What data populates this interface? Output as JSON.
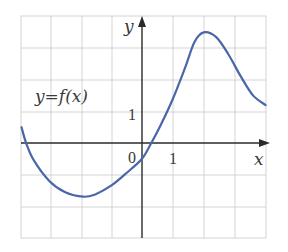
{
  "chart_data": {
    "type": "line",
    "title": "",
    "function_label": "y=f(x)",
    "xlabel": "x",
    "ylabel": "y",
    "origin_label": "0",
    "x_tick_label": "1",
    "y_tick_label": "1",
    "xlim": [
      -3.9,
      4.0
    ],
    "ylim": [
      -3.05,
      4.1
    ],
    "grid": true,
    "grid_step": 1,
    "series": [
      {
        "name": "f(x)",
        "color": "#4a66a8",
        "points": [
          [
            -3.9,
            0.5
          ],
          [
            -3.75,
            0.0
          ],
          [
            -3.5,
            -0.55
          ],
          [
            -3.0,
            -1.2
          ],
          [
            -2.5,
            -1.55
          ],
          [
            -1.9,
            -1.7
          ],
          [
            -1.5,
            -1.62
          ],
          [
            -1.0,
            -1.35
          ],
          [
            -0.5,
            -0.95
          ],
          [
            0.0,
            -0.5
          ],
          [
            0.3,
            0.0
          ],
          [
            0.6,
            0.55
          ],
          [
            1.0,
            1.4
          ],
          [
            1.4,
            2.4
          ],
          [
            1.7,
            3.2
          ],
          [
            2.0,
            3.5
          ],
          [
            2.4,
            3.35
          ],
          [
            2.8,
            2.8
          ],
          [
            3.2,
            2.1
          ],
          [
            3.6,
            1.5
          ],
          [
            4.0,
            1.2
          ]
        ]
      }
    ],
    "key_points": {
      "local_min": [
        -1.9,
        -1.7
      ],
      "local_max": [
        2.0,
        3.5
      ],
      "y_intercept": -0.5,
      "x_intercepts": [
        -3.75,
        0.3
      ]
    }
  }
}
